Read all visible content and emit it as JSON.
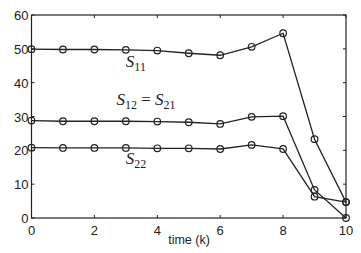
{
  "chart_data": {
    "type": "line",
    "title": "",
    "xlabel": "time (k)",
    "ylabel": "",
    "xlim": [
      0,
      10
    ],
    "ylim": [
      0,
      60
    ],
    "xticks": [
      0,
      2,
      4,
      6,
      8,
      10
    ],
    "yticks": [
      0,
      10,
      20,
      30,
      40,
      50,
      60
    ],
    "grid": false,
    "legend": "none (inline annotations)",
    "marker": "circle",
    "x": [
      0,
      1,
      2,
      3,
      4,
      5,
      6,
      7,
      8,
      9,
      10
    ],
    "series": [
      {
        "name": "S11",
        "values": [
          49.9,
          49.8,
          49.8,
          49.7,
          49.5,
          48.7,
          48.1,
          50.6,
          54.6,
          23.3,
          4.7
        ]
      },
      {
        "name": "S12 = S21",
        "values": [
          28.8,
          28.6,
          28.6,
          28.6,
          28.5,
          28.3,
          27.8,
          29.9,
          30.1,
          8.3,
          0.0
        ]
      },
      {
        "name": "S22",
        "values": [
          20.8,
          20.7,
          20.7,
          20.7,
          20.6,
          20.6,
          20.4,
          21.6,
          20.4,
          6.3,
          4.7
        ]
      }
    ],
    "annotations": [
      {
        "label": "S11",
        "base": "S",
        "sub": "11",
        "x": 3.0,
        "y": 44.5
      },
      {
        "label": "S12 = S21",
        "base1": "S",
        "sub1": "12",
        "eq": " = ",
        "base2": "S",
        "sub2": "21",
        "x": 2.7,
        "y": 33.5
      },
      {
        "label": "S22",
        "base": "S",
        "sub": "22",
        "x": 3.0,
        "y": 16.0
      }
    ]
  }
}
